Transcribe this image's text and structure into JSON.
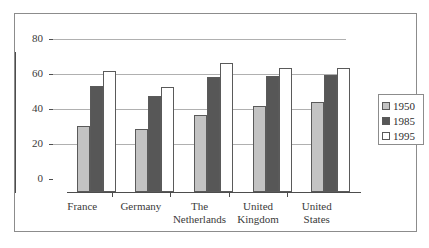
{
  "chart_data": {
    "type": "bar",
    "title": "",
    "subtitle": "",
    "xlabel": "",
    "ylabel": "",
    "ylim": [
      0,
      80
    ],
    "yticks": [
      0,
      20,
      40,
      60,
      80
    ],
    "ytick_labels": [
      "0",
      "20",
      "40",
      "60",
      "80"
    ],
    "grid": true,
    "legend_position": "right",
    "categories": [
      "France",
      "Germany",
      "The Netherlands",
      "United Kingdom",
      "United States"
    ],
    "category_lines": [
      [
        "France"
      ],
      [
        "Germany"
      ],
      [
        "The",
        "Netherlands"
      ],
      [
        "United",
        "Kingdom"
      ],
      [
        "United",
        "States"
      ]
    ],
    "series": [
      {
        "name": "1950",
        "color": "#c3c3c3",
        "values": [
          38,
          36,
          44,
          49,
          51.5
        ]
      },
      {
        "name": "1985",
        "color": "#575757",
        "values": [
          60.5,
          55,
          66,
          66.5,
          67
        ]
      },
      {
        "name": "1995",
        "color": "#ffffff",
        "values": [
          69,
          60,
          74,
          71,
          71
        ]
      }
    ]
  },
  "legend": {
    "entries": [
      {
        "label": "1950",
        "swatch": "light-gray"
      },
      {
        "label": "1985",
        "swatch": "dark-gray"
      },
      {
        "label": "1995",
        "swatch": "white"
      }
    ]
  },
  "colors": {
    "series_1950": "#c3c3c3",
    "series_1985": "#575757",
    "series_1995": "#ffffff",
    "bar_outline": "#5a5a5a",
    "axis": "#4d4d4d",
    "gridline": "#b0b0b0",
    "frame": "#8c8c8c",
    "background": "#ffffff",
    "text": "#333333"
  }
}
